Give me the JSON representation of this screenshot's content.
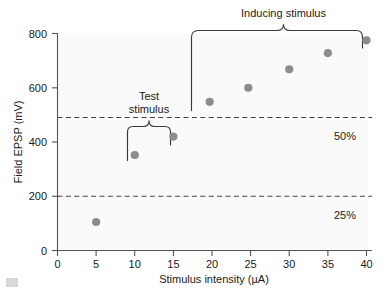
{
  "chart_data": {
    "type": "scatter",
    "title": "",
    "xlabel": "Stimulus intensity (µA)",
    "ylabel": "Field EPSP (mV)",
    "xlim": [
      0,
      42
    ],
    "ylim": [
      0,
      830
    ],
    "grid": false,
    "legend": null,
    "x": [
      5,
      10,
      15,
      19.7,
      24.7,
      30,
      35,
      40
    ],
    "values": [
      105,
      352,
      420,
      548,
      600,
      668,
      728,
      775
    ],
    "points": [
      {
        "x": 5,
        "y": 105
      },
      {
        "x": 10,
        "y": 352
      },
      {
        "x": 15,
        "y": 420
      },
      {
        "x": 19.7,
        "y": 548
      },
      {
        "x": 24.7,
        "y": 600
      },
      {
        "x": 30,
        "y": 668
      },
      {
        "x": 35,
        "y": 728
      },
      {
        "x": 40,
        "y": 775
      }
    ],
    "xticks": [
      0,
      5,
      10,
      15,
      20,
      25,
      30,
      35,
      40
    ],
    "xtick_labels": [
      "0",
      "5",
      "10",
      "15",
      "20",
      "25",
      "30",
      "35",
      "40"
    ],
    "yticks": [
      0,
      200,
      400,
      600,
      800
    ],
    "ytick_labels": [
      "0",
      "200",
      "400",
      "600",
      "800"
    ],
    "reference_lines": [
      {
        "label": "50%",
        "y": 490
      },
      {
        "label": "25%",
        "y": 200
      }
    ],
    "annotations": [
      {
        "label": "Inducing stimulus",
        "x_range": [
          18.6,
          41.0
        ],
        "text_x": 30.0
      },
      {
        "label_line1": "Test",
        "label_line2": "stimulus",
        "x_range": [
          9.0,
          15.7
        ],
        "text_x": 12.3
      }
    ],
    "marker_color": "#8c8c8c",
    "plot_background": "#fafafa"
  },
  "labels": {
    "y_axis_title": "Field EPSP (mV)",
    "x_axis_title": "Stimulus intensity (µA)",
    "inducing_stimulus": "Inducing stimulus",
    "test_stimulus_line1": "Test",
    "test_stimulus_line2": "stimulus",
    "pct_50": "50%",
    "pct_25": "25%",
    "ytick_800": "800",
    "ytick_600": "600",
    "ytick_400": "400",
    "ytick_200": "200",
    "ytick_0": "0",
    "xtick_0": "0",
    "xtick_5": "5",
    "xtick_10": "10",
    "xtick_15": "15",
    "xtick_20": "20",
    "xtick_25": "25",
    "xtick_30": "30",
    "xtick_35": "35",
    "xtick_40": "40"
  }
}
